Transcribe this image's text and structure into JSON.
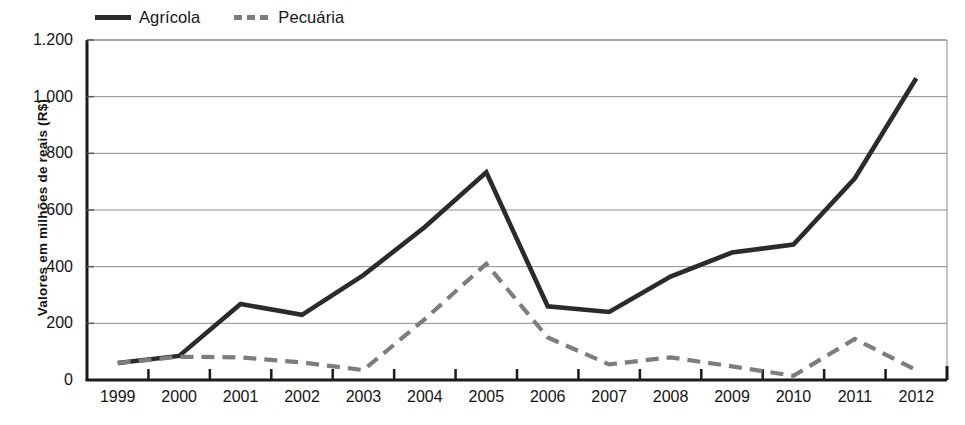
{
  "chart_data": {
    "type": "line",
    "title": "",
    "xlabel": "",
    "ylabel": "Valores  em milhões de reais (R$)",
    "categories": [
      "1999",
      "2000",
      "2001",
      "2002",
      "2003",
      "2004",
      "2005",
      "2006",
      "2007",
      "2008",
      "2009",
      "2010",
      "2011",
      "2012"
    ],
    "ylim": [
      0,
      1200
    ],
    "yticks": [
      0,
      200,
      400,
      600,
      800,
      1000,
      1200
    ],
    "ytick_labels": [
      "0",
      "200",
      "400",
      "600",
      "800",
      "1.000",
      "1.200"
    ],
    "grid": "horizontal",
    "legend_position": "top-left",
    "series": [
      {
        "name": "Agrícola",
        "style": "solid",
        "color": "#2b2b2b",
        "values": [
          60,
          85,
          268,
          230,
          370,
          540,
          733,
          260,
          240,
          365,
          450,
          478,
          712,
          1065
        ]
      },
      {
        "name": "Pecuária",
        "style": "dashed",
        "color": "#7d7d7d",
        "values": [
          60,
          82,
          80,
          62,
          35,
          215,
          410,
          150,
          55,
          80,
          48,
          15,
          145,
          35
        ]
      }
    ]
  },
  "legend": {
    "items": [
      {
        "label": "Agrícola",
        "marker": "solid-line-swatch"
      },
      {
        "label": "Pecuária",
        "marker": "dashed-line-swatch"
      }
    ]
  }
}
